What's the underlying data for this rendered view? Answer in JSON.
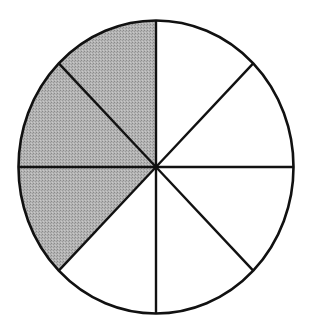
{
  "diagram": {
    "type": "fraction-circle",
    "total_sectors": 8,
    "shaded_sectors": 3,
    "fraction_shaded": "3/8",
    "center": [
      156,
      167
    ],
    "radius_x": 137.5,
    "radius_y": 146.5,
    "colors": {
      "background": "#ffffff",
      "outline": "#111111",
      "shaded": "#a9a9a9",
      "unshaded": "#ffffff"
    },
    "sectors": [
      {
        "index": 0,
        "start_deg": 90,
        "end_deg": 135,
        "shaded": true
      },
      {
        "index": 1,
        "start_deg": 135,
        "end_deg": 180,
        "shaded": true
      },
      {
        "index": 2,
        "start_deg": 180,
        "end_deg": 225,
        "shaded": true
      },
      {
        "index": 3,
        "start_deg": 225,
        "end_deg": 270,
        "shaded": false
      },
      {
        "index": 4,
        "start_deg": 270,
        "end_deg": 315,
        "shaded": false
      },
      {
        "index": 5,
        "start_deg": 315,
        "end_deg": 360,
        "shaded": false
      },
      {
        "index": 6,
        "start_deg": 0,
        "end_deg": 45,
        "shaded": false
      },
      {
        "index": 7,
        "start_deg": 45,
        "end_deg": 90,
        "shaded": false
      }
    ]
  }
}
